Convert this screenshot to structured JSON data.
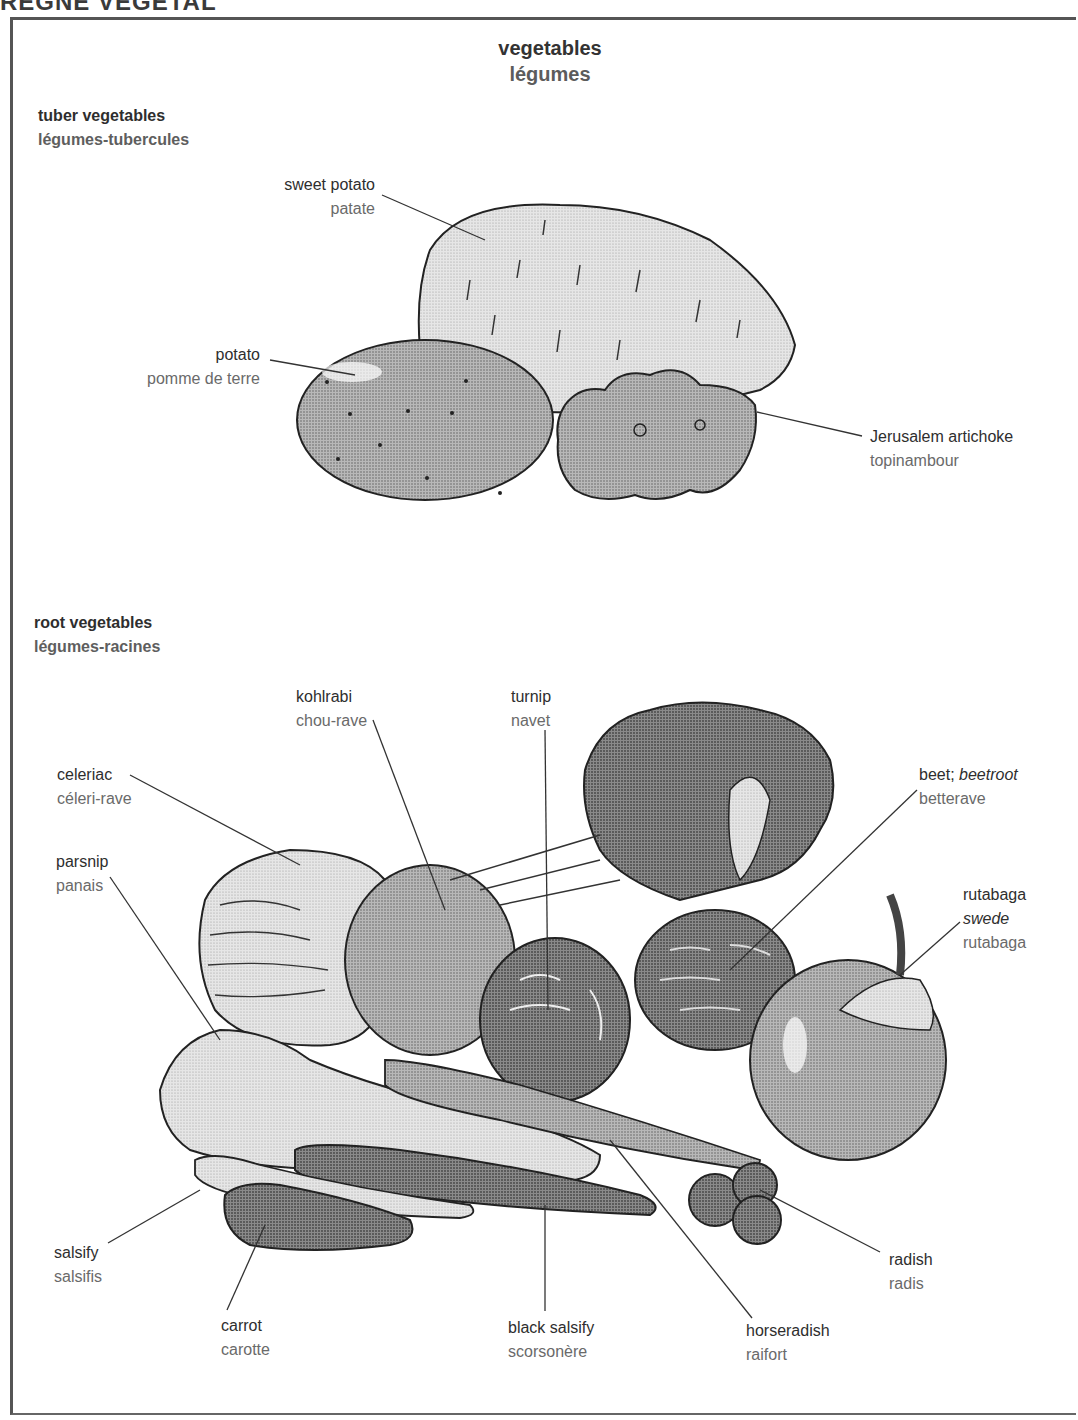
{
  "page_header": "RÈGNE VÉGÉTAL",
  "title": {
    "en": "vegetables",
    "fr": "légumes"
  },
  "sections": {
    "tuber": {
      "heading": {
        "en": "tuber vegetables",
        "fr": "légumes-tubercules"
      },
      "items": [
        {
          "en": "sweet potato",
          "fr": "patate"
        },
        {
          "en": "potato",
          "fr": "pomme de terre"
        },
        {
          "en": "Jerusalem artichoke",
          "fr": "topinambour"
        }
      ]
    },
    "root": {
      "heading": {
        "en": "root vegetables",
        "fr": "légumes-racines"
      },
      "items": [
        {
          "en": "kohlrabi",
          "fr": "chou-rave"
        },
        {
          "en": "turnip",
          "fr": "navet"
        },
        {
          "en": "celeriac",
          "fr": "céleri-rave"
        },
        {
          "en": "beet;",
          "en_alt": "beetroot",
          "fr": "betterave"
        },
        {
          "en": "parsnip",
          "fr": "panais"
        },
        {
          "en": "rutabaga",
          "en_alt": "swede",
          "fr": "rutabaga"
        },
        {
          "en": "salsify",
          "fr": "salsifis"
        },
        {
          "en": "radish",
          "fr": "radis"
        },
        {
          "en": "carrot",
          "fr": "carotte"
        },
        {
          "en": "black salsify",
          "fr": "scorsonère"
        },
        {
          "en": "horseradish",
          "fr": "raifort"
        }
      ]
    }
  }
}
